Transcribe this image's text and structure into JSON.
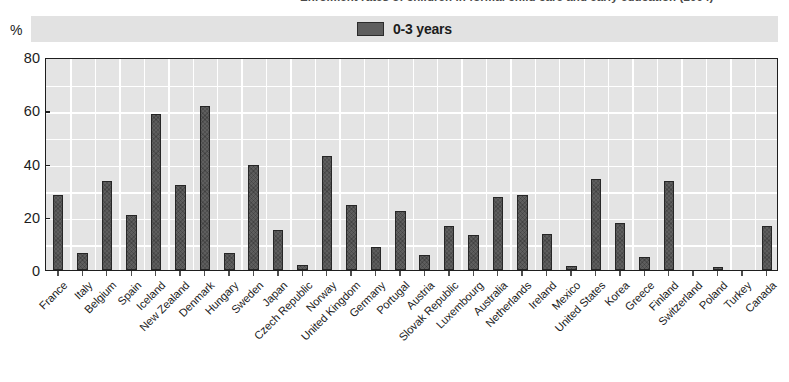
{
  "title": {
    "text": "Enrolment rates of children in formal child care and early education (2004)"
  },
  "axes": {
    "y_unit_symbol": "%",
    "y_ticks": [
      0,
      20,
      40,
      60,
      80
    ],
    "y_min": 0,
    "y_max": 80
  },
  "legend": {
    "entries": [
      {
        "label": "0-3 years",
        "color": "#5e5e5e"
      }
    ]
  },
  "colors": {
    "bar_fill": "#5e5e5e",
    "bar_edge": "#262626",
    "plot_background": "#e4e4e4",
    "gridline": "#ffffff",
    "legend_band": "#e2e2e2",
    "axis": "#1e1e1e",
    "text": "#1c1c1c"
  },
  "chart_data": {
    "type": "bar",
    "title": "Enrolment rates of children in formal child care and early education (2004)",
    "xlabel": "",
    "ylabel": "%",
    "ylim": [
      0,
      80
    ],
    "yticks": [
      0,
      20,
      40,
      60,
      80
    ],
    "grid": true,
    "legend_position": "top-center",
    "categories": [
      "France",
      "Italy",
      "Belgium",
      "Spain",
      "Iceland",
      "New Zealand",
      "Denmark",
      "Hungary",
      "Sweden",
      "Japan",
      "Czech Republic",
      "Norway",
      "United Kingdom",
      "Germany",
      "Portugal",
      "Austria",
      "Slovak Republic",
      "Luxembourg",
      "Australia",
      "Netherlands",
      "Ireland",
      "Mexico",
      "United States",
      "Korea",
      "Greece",
      "Finland",
      "Switzerland",
      "Poland",
      "Turkey",
      "Canada"
    ],
    "series": [
      {
        "name": "0-3 years",
        "color": "#5e5e5e",
        "values": [
          28,
          6.5,
          33.5,
          20.5,
          58.5,
          32,
          61.5,
          6.5,
          39.5,
          15,
          2,
          43,
          24.5,
          8.5,
          22,
          5.5,
          16.5,
          13,
          27.5,
          28,
          13.5,
          1.5,
          34,
          17.5,
          5,
          33.5,
          0,
          1,
          0,
          16.5
        ]
      }
    ]
  }
}
